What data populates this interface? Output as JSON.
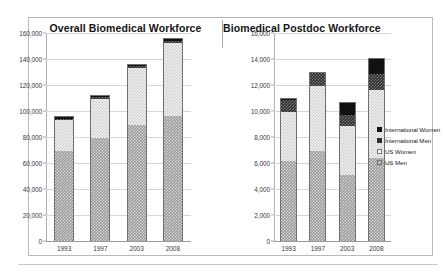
{
  "figure": {
    "panels": [
      {
        "id": "overall",
        "title": "Overall Biomedical Workforce"
      },
      {
        "id": "postdoc",
        "title": "Biomedical Postdoc Workforce"
      }
    ],
    "legend": {
      "items": [
        {
          "label": "International Women",
          "swatch": "intl-women",
          "color": "#111111"
        },
        {
          "label": "International Men",
          "swatch": "intl-men",
          "color": "#2c2c2c"
        },
        {
          "label": "US Women",
          "swatch": "us-women",
          "color": "#f4f4f4"
        },
        {
          "label": "US Men",
          "swatch": "us-men",
          "color": "#9b9b9b"
        }
      ]
    }
  },
  "chart_data": [
    {
      "type": "bar",
      "stacked": true,
      "title": "Overall Biomedical Workforce",
      "xlabel": "",
      "ylabel": "",
      "categories": [
        "1993",
        "1997",
        "2003",
        "2008"
      ],
      "ylim": [
        0,
        160000
      ],
      "yticks": [
        0,
        20000,
        40000,
        60000,
        80000,
        100000,
        120000,
        140000,
        160000
      ],
      "ytick_labels": [
        "0",
        "20,000",
        "40,000",
        "60,000",
        "80,000",
        "100,000",
        "120,000",
        "140,000",
        "160,000"
      ],
      "grid": true,
      "legend_position": "right",
      "series": [
        {
          "name": "US Men",
          "values": [
            70000,
            80000,
            90000,
            97000
          ]
        },
        {
          "name": "US Women",
          "values": [
            24000,
            30000,
            44000,
            56000
          ]
        },
        {
          "name": "International Men",
          "values": [
            1000,
            1300,
            1600,
            2000
          ]
        },
        {
          "name": "International Women",
          "values": [
            1000,
            1200,
            700,
            1000
          ]
        }
      ],
      "totals": [
        96000,
        112500,
        136300,
        156000
      ]
    },
    {
      "type": "bar",
      "stacked": true,
      "title": "Biomedical Postdoc Workforce",
      "xlabel": "",
      "ylabel": "",
      "categories": [
        "1993",
        "1997",
        "2003",
        "2008"
      ],
      "ylim": [
        0,
        16000
      ],
      "yticks": [
        0,
        2000,
        4000,
        6000,
        8000,
        10000,
        12000,
        14000,
        16000
      ],
      "ytick_labels": [
        "0",
        "2,000",
        "4,000",
        "6,000",
        "8,000",
        "10,000",
        "12,000",
        "14,000",
        "16,000"
      ],
      "grid": true,
      "legend_position": "right",
      "series": [
        {
          "name": "US Men",
          "values": [
            6200,
            7000,
            5100,
            6400
          ]
        },
        {
          "name": "US Women",
          "values": [
            3800,
            5000,
            3800,
            5300
          ]
        },
        {
          "name": "International Men",
          "values": [
            900,
            1000,
            900,
            1200
          ]
        },
        {
          "name": "International Women",
          "values": [
            100,
            0,
            900,
            1200
          ]
        }
      ],
      "totals": [
        11000,
        13000,
        10700,
        14100
      ]
    }
  ]
}
